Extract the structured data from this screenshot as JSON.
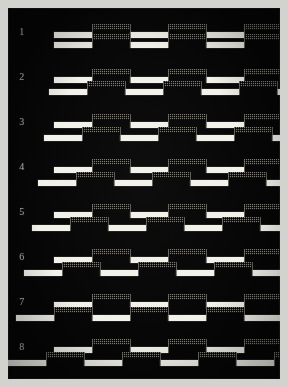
{
  "plate": {
    "background_color": "#050505",
    "paper_color": "#d2d2ce",
    "white_bar_color": "#f2f1ea",
    "dither_bar_color": "#7d7d76"
  },
  "chart_data": {
    "type": "line",
    "title": "",
    "xlabel": "",
    "ylabel": "",
    "grid": false,
    "legend": "none",
    "series_styles": [
      {
        "name": "white-bar-trace",
        "render": "solid white segment"
      },
      {
        "name": "dithered-bar-trace",
        "render": "gray stipple segment"
      }
    ],
    "row_labels": [
      "1",
      "2",
      "3",
      "4",
      "5",
      "6",
      "7",
      "8"
    ],
    "period_px": 76,
    "segment_width_px": 38,
    "x_start_px": 46,
    "x_end_px": 272,
    "rows": [
      {
        "label": "1",
        "phase_shift_px": 0,
        "upper": {
          "y_high": 12,
          "y_low": 20,
          "start_px": 46
        },
        "lower": {
          "y_high": 22,
          "y_low": 30,
          "start_px": 46
        }
      },
      {
        "label": "2",
        "phase_shift_px": 5,
        "upper": {
          "y_high": 12,
          "y_low": 20,
          "start_px": 46
        },
        "lower": {
          "y_high": 24,
          "y_low": 32,
          "start_px": 41
        }
      },
      {
        "label": "3",
        "phase_shift_px": 10,
        "upper": {
          "y_high": 12,
          "y_low": 20,
          "start_px": 46
        },
        "lower": {
          "y_high": 25,
          "y_low": 33,
          "start_px": 36
        }
      },
      {
        "label": "4",
        "phase_shift_px": 16,
        "upper": {
          "y_high": 12,
          "y_low": 20,
          "start_px": 46
        },
        "lower": {
          "y_high": 25,
          "y_low": 33,
          "start_px": 30
        }
      },
      {
        "label": "5",
        "phase_shift_px": 22,
        "upper": {
          "y_high": 12,
          "y_low": 20,
          "start_px": 46
        },
        "lower": {
          "y_high": 25,
          "y_low": 33,
          "start_px": 24
        }
      },
      {
        "label": "6",
        "phase_shift_px": 30,
        "upper": {
          "y_high": 12,
          "y_low": 20,
          "start_px": 46
        },
        "lower": {
          "y_high": 25,
          "y_low": 33,
          "start_px": 16
        }
      },
      {
        "label": "7",
        "phase_shift_px": 38,
        "upper": {
          "y_high": 12,
          "y_low": 20,
          "start_px": 46
        },
        "lower": {
          "y_high": 25,
          "y_low": 33,
          "start_px": 8
        }
      },
      {
        "label": "8",
        "phase_shift_px": 46,
        "upper": {
          "y_high": 12,
          "y_low": 20,
          "start_px": 46
        },
        "lower": {
          "y_high": 25,
          "y_low": 33,
          "start_px": 0
        }
      }
    ]
  }
}
